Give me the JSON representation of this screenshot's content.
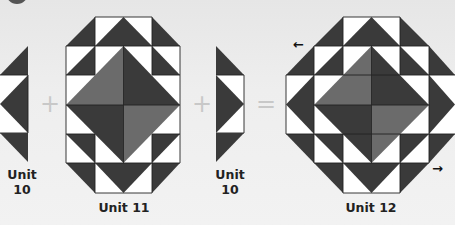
{
  "colors": {
    "dark": "#3a3a3a",
    "medium": "#6a6a6a",
    "light": "#ffffff",
    "outline": "#222222",
    "operator": "#c8c8c8"
  },
  "units": [
    {
      "id": "unit-10-left",
      "label_line1": "Unit",
      "label_line2": "10"
    },
    {
      "id": "unit-11",
      "label": "Unit 11"
    },
    {
      "id": "unit-10-right",
      "label_line1": "Unit",
      "label_line2": "10"
    },
    {
      "id": "unit-12",
      "label": "Unit 12"
    }
  ],
  "operators": {
    "plus1": "+",
    "plus2": "+",
    "equals": "="
  },
  "arrows": {
    "left": "←",
    "right": "→"
  }
}
